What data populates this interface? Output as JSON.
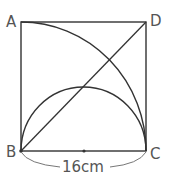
{
  "figure": {
    "type": "geometry",
    "shape": "square",
    "vertices": {
      "A": {
        "label": "A",
        "position": "top-left"
      },
      "D": {
        "label": "D",
        "position": "top-right"
      },
      "B": {
        "label": "B",
        "position": "bottom-left"
      },
      "C": {
        "label": "C",
        "position": "bottom-right"
      }
    },
    "elements": [
      {
        "kind": "square",
        "name": "ABCD"
      },
      {
        "kind": "diagonal",
        "from": "B",
        "to": "D"
      },
      {
        "kind": "quarter-circle-arc",
        "center": "B",
        "from": "A",
        "to": "C"
      },
      {
        "kind": "semicircle",
        "diameter": "BC",
        "direction": "up"
      },
      {
        "kind": "midpoint-dot",
        "on": "BC"
      },
      {
        "kind": "dimension-brace",
        "segment": "BC"
      }
    ],
    "dimension": {
      "label": "16cm",
      "value": 16,
      "unit": "cm",
      "segment": "BC"
    }
  },
  "colors": {
    "stroke": "#333333",
    "label": "#555555",
    "brace": "#777777",
    "background": "#ffffff"
  }
}
